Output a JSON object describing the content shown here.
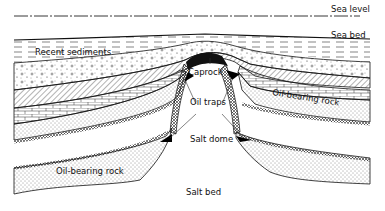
{
  "diagram": {
    "labels": {
      "sea_level": "Sea level",
      "sea_bed": "Sea bed",
      "recent_sediments": "Recent sediments",
      "caprock": "Caprock",
      "oil_traps": "Oil traps",
      "oil_bearing_rock_right": "Oil-bearing rock",
      "oil_bearing_rock_left": "Oil-bearing rock",
      "salt_dome": "Salt dome",
      "salt_bed": "Salt bed"
    },
    "colors": {
      "ink": "#111111",
      "background": "#ffffff",
      "oil": "#000000"
    }
  }
}
